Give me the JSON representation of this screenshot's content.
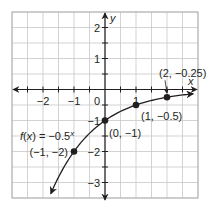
{
  "chart_data": {
    "type": "line",
    "title": "",
    "function_label": "f(x) = −0.5^x",
    "xlabel": "x",
    "ylabel": "y",
    "xlim": [
      -3,
      3
    ],
    "ylim": [
      -3.5,
      2.5
    ],
    "grid": true,
    "grid_step": 0.5,
    "x_ticks": [
      -2,
      -1,
      0,
      1
    ],
    "x_tick_labels": [
      "−2",
      "−1",
      "0",
      "1"
    ],
    "y_ticks": [
      2,
      1,
      -1,
      -2,
      -3
    ],
    "y_tick_labels": [
      "2",
      "1",
      "−1",
      "−2",
      "−3"
    ],
    "series": [
      {
        "name": "f(x) = -0.5^x",
        "points": [
          {
            "x": -1,
            "y": -2,
            "label": "(−1, −2)"
          },
          {
            "x": 0,
            "y": -1,
            "label": "(0, −1)"
          },
          {
            "x": 1,
            "y": -0.5,
            "label": "(1, −0.5)"
          },
          {
            "x": 2,
            "y": -0.25,
            "label": "(2, −0.25)"
          }
        ]
      }
    ],
    "colors": {
      "curve": "#231f20",
      "grid": "#c8c8c8",
      "axis": "#231f20",
      "text": "#231f20"
    }
  }
}
